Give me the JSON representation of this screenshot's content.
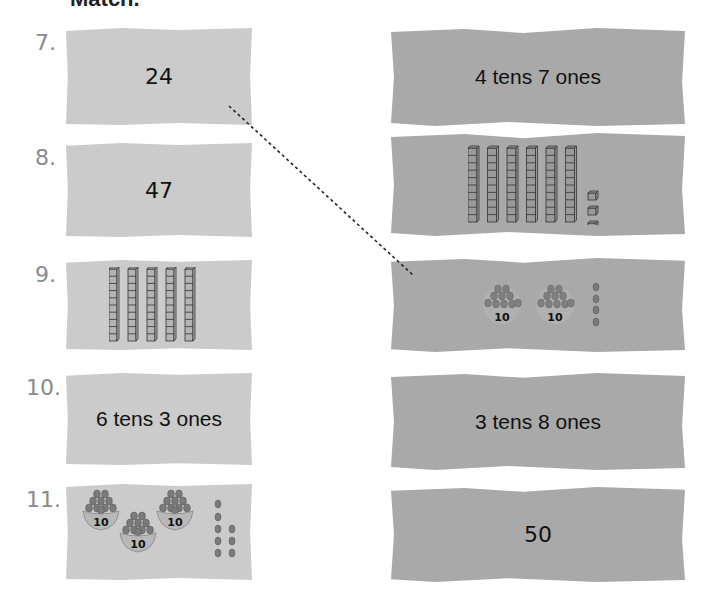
{
  "header": {
    "title": "Match."
  },
  "items": [
    {
      "number": "7.",
      "left": {
        "type": "number",
        "text": "24"
      },
      "right": {
        "type": "words",
        "text": "4 tens  7 ones"
      }
    },
    {
      "number": "8.",
      "left": {
        "type": "number",
        "text": "47"
      },
      "right": {
        "type": "blocks",
        "tens": 6,
        "ones": 3
      }
    },
    {
      "number": "9.",
      "left": {
        "type": "blocks",
        "tens": 5,
        "ones": 0
      },
      "right": {
        "type": "baskets",
        "tens": 2,
        "ones": 4,
        "basket_label": "10"
      }
    },
    {
      "number": "10.",
      "left": {
        "type": "words",
        "text": "6 tens  3 ones"
      },
      "right": {
        "type": "words",
        "text": "3 tens  8 ones"
      }
    },
    {
      "number": "11.",
      "left": {
        "type": "baskets",
        "tens": 3,
        "ones": 8,
        "basket_label": "10"
      },
      "right": {
        "type": "number",
        "text": "50"
      }
    }
  ],
  "basket_label": "10",
  "match_line": {
    "from_item": "7",
    "to_item": "9-right",
    "style": "dashed"
  },
  "colors": {
    "left_card": "#cbcbcb",
    "right_card": "#a9a9a9",
    "number_label": "#8a8a8a",
    "text": "#111111"
  }
}
